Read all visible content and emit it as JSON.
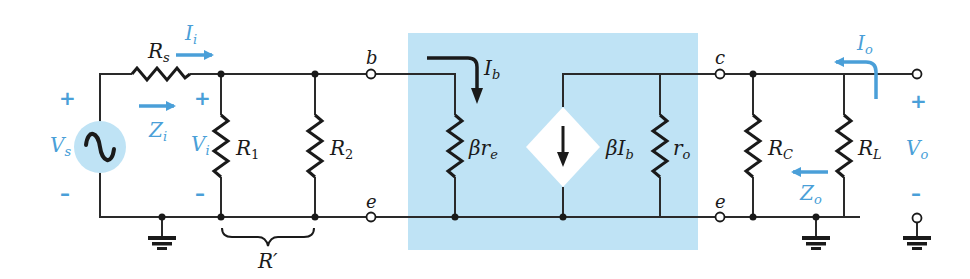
{
  "colors": {
    "wire": "#2a2a2a",
    "accent_blue": "#4a9fd8",
    "transistor_box": "#bfe3f5",
    "source_fill": "#bfe3f5",
    "background": "#ffffff"
  },
  "figure": {
    "source": {
      "voltage_label": "V",
      "voltage_sub": "s",
      "plus": "+",
      "minus": "–",
      "icon": "ac-sine-source-icon"
    },
    "source_resistor": {
      "label": "R",
      "sub": "s"
    },
    "input_current": {
      "label": "I",
      "sub": "i"
    },
    "input_impedance": {
      "label": "Z",
      "sub": "i"
    },
    "input_voltage": {
      "label": "V",
      "sub": "i",
      "plus": "+",
      "minus": "–"
    },
    "bias_resistors": [
      {
        "label": "R",
        "sub": "1"
      },
      {
        "label": "R",
        "sub": "2"
      }
    ],
    "parallel_brace": {
      "label": "R′"
    },
    "terminals": {
      "base": "b",
      "emitter_in": "e",
      "collector": "c",
      "emitter_out": "e"
    },
    "transistor_model": {
      "base_current": {
        "label": "I",
        "sub": "b"
      },
      "input_resistance": {
        "label": "βr",
        "sub": "e"
      },
      "dependent_source": {
        "label": "βI",
        "sub": "b",
        "icon": "dependent-current-source-down-icon"
      },
      "output_resistance": {
        "label": "r",
        "sub": "o"
      }
    },
    "collector_resistor": {
      "label": "R",
      "sub": "C"
    },
    "load_resistor": {
      "label": "R",
      "sub": "L"
    },
    "output_current": {
      "label": "I",
      "sub": "o"
    },
    "output_impedance": {
      "label": "Z",
      "sub": "o"
    },
    "output_voltage": {
      "label": "V",
      "sub": "o",
      "plus": "+",
      "minus": "–"
    }
  }
}
